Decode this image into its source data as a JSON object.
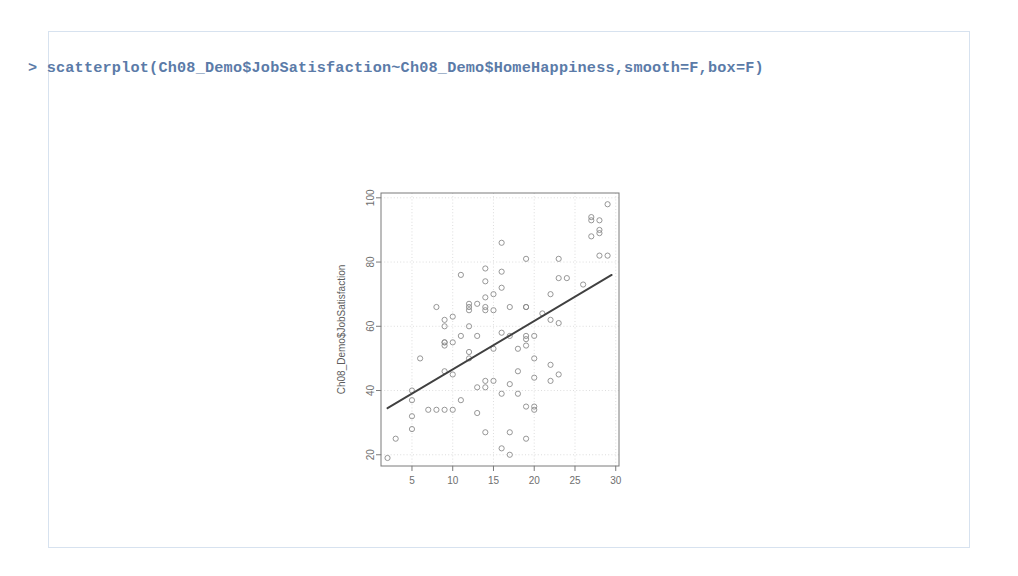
{
  "document": {
    "background_color": "#ffffff",
    "frame_color": "#d7e2ef"
  },
  "console": {
    "prompt": "> ",
    "command": "scatterplot(Ch08_Demo$JobSatisfaction~Ch08_Demo$HomeHappiness,smooth=F,box=F)",
    "text_color": "#5b7ba8"
  },
  "chart_data": {
    "type": "scatter",
    "title": "",
    "xlabel": "Ch08_Demo$HomeHappiness",
    "ylabel": "Ch08_Demo$JobSatisfaction",
    "xlim": [
      1.2,
      30.4
    ],
    "ylim": [
      16.5,
      101.5
    ],
    "xticks": [
      5,
      10,
      15,
      20,
      25,
      30
    ],
    "yticks": [
      20,
      40,
      60,
      80,
      100
    ],
    "grid": true,
    "grid_style": "dotted",
    "legend": null,
    "point_color": "#8b8b8b",
    "point_marker": "open-circle",
    "line_color": "#404040",
    "regression_line": {
      "label": "least-squares fit",
      "x": [
        2.0,
        29.5
      ],
      "y": [
        34.5,
        76.0
      ]
    },
    "x": [
      2,
      3,
      5,
      5,
      5,
      5,
      6,
      7,
      8,
      8,
      9,
      9,
      9,
      9,
      9,
      9,
      9,
      10,
      10,
      10,
      10,
      11,
      11,
      11,
      12,
      12,
      12,
      12,
      12,
      12,
      13,
      13,
      13,
      13,
      14,
      14,
      14,
      14,
      14,
      14,
      14,
      14,
      15,
      15,
      15,
      15,
      16,
      16,
      16,
      16,
      16,
      16,
      17,
      17,
      17,
      17,
      17,
      18,
      18,
      18,
      19,
      19,
      19,
      19,
      19,
      19,
      19,
      19,
      20,
      20,
      20,
      20,
      20,
      21,
      22,
      22,
      22,
      22,
      23,
      23,
      23,
      23,
      24,
      26,
      27,
      27,
      27,
      28,
      28,
      28,
      28,
      29,
      29
    ],
    "y": [
      19,
      25,
      40,
      37,
      32,
      28,
      50,
      34,
      66,
      34,
      62,
      60,
      55,
      55,
      54,
      46,
      34,
      63,
      55,
      45,
      34,
      76,
      57,
      37,
      67,
      66,
      65,
      60,
      52,
      50,
      67,
      57,
      41,
      33,
      78,
      74,
      69,
      66,
      65,
      43,
      27,
      41,
      70,
      65,
      53,
      43,
      86,
      77,
      72,
      58,
      39,
      22,
      66,
      57,
      42,
      27,
      20,
      53,
      46,
      39,
      81,
      66,
      66,
      57,
      56,
      54,
      35,
      25,
      57,
      50,
      44,
      35,
      34,
      64,
      70,
      62,
      48,
      43,
      81,
      75,
      61,
      45,
      75,
      73,
      94,
      93,
      88,
      93,
      90,
      89,
      82,
      98,
      82
    ]
  }
}
